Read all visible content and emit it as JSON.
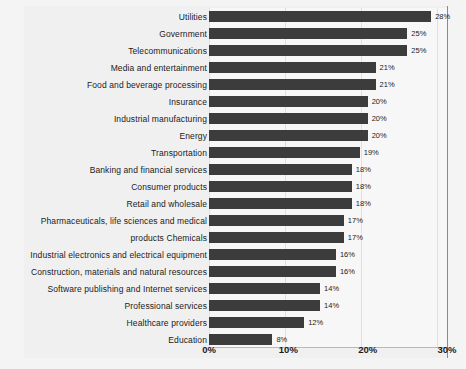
{
  "chart_data": {
    "type": "bar",
    "orientation": "horizontal",
    "title": "",
    "xlabel": "",
    "ylabel": "",
    "xlim": [
      0,
      30
    ],
    "grid": true,
    "legend": false,
    "value_suffix": "%",
    "xticks": [
      "0%",
      "10%",
      "20%",
      "30%"
    ],
    "xtick_values": [
      0,
      10,
      20,
      30
    ],
    "bar_color": "#3c3c3c",
    "plot_background": "#f7f7f7",
    "page_background": "#f4f4f4",
    "categories": [
      "Utilities",
      "Government",
      "Telecommunications",
      "Media and entertainment",
      "Food and beverage processing",
      "Insurance",
      "Industrial manufacturing",
      "Energy",
      "Transportation",
      "Banking and financial services",
      "Consumer products",
      "Retail and wholesale",
      "Pharmaceuticals, life sciences and medical",
      "products Chemicals",
      "Industrial electronics and electrical equipment",
      "Construction, materials and natural resources",
      "Software publishing and Internet services",
      "Professional services",
      "Healthcare providers",
      "Education"
    ],
    "values": [
      28,
      25,
      25,
      21,
      21,
      20,
      20,
      20,
      19,
      18,
      18,
      18,
      17,
      17,
      16,
      16,
      14,
      14,
      12,
      8
    ],
    "value_labels": [
      "28%",
      "25%",
      "25%",
      "21%",
      "21%",
      "20%",
      "20%",
      "20%",
      "19%",
      "18%",
      "18%",
      "18%",
      "17%",
      "17%",
      "16%",
      "16%",
      "14%",
      "14%",
      "12%",
      "8%"
    ]
  }
}
